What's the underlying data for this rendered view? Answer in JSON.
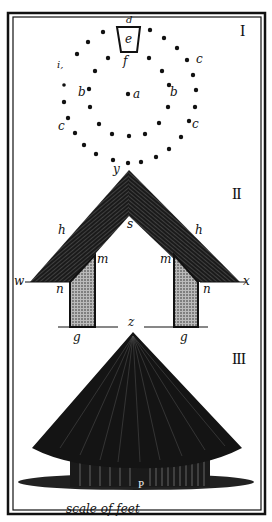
{
  "figure": {
    "sections": [
      {
        "numeral": "I",
        "caption": "plan of post circles"
      },
      {
        "numeral": "II",
        "caption": "section"
      },
      {
        "numeral": "III",
        "caption": "elevation"
      }
    ],
    "labels_I": {
      "d": "d",
      "e": "e",
      "f": "f",
      "a": "a",
      "b_left": "b",
      "b_right": "b",
      "c_top_right": "c",
      "c_left": "c",
      "c_right": "c",
      "i": "i,",
      "y": "y"
    },
    "labels_II": {
      "y": "y",
      "s": "s",
      "h_left": "h",
      "h_right": "h",
      "m_left": "m",
      "m_right": "m",
      "n_left": "n",
      "n_right": "n",
      "w": "w",
      "x": "x",
      "g_left": "g",
      "g_right": "g",
      "z": "z"
    },
    "labels_III": {
      "p": "P"
    },
    "scale_label": "scale of feet",
    "colors": {
      "ink": "#111111",
      "paper": "#ffffff",
      "hatch": "#777777"
    }
  }
}
